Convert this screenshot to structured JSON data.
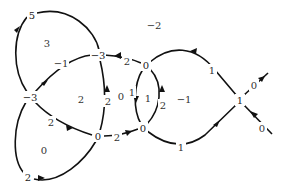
{
  "diagram": {
    "vertices": [
      {
        "id": "v5",
        "label": "5",
        "x": 32,
        "y": 15
      },
      {
        "id": "vL",
        "label": "−3",
        "x": 30,
        "y": 97
      },
      {
        "id": "vT",
        "label": "−3",
        "x": 98,
        "y": 55
      },
      {
        "id": "v0top",
        "label": "0",
        "x": 146,
        "y": 65
      },
      {
        "id": "v0mid",
        "label": "0",
        "x": 98,
        "y": 136
      },
      {
        "id": "v0br",
        "label": "0",
        "x": 143,
        "y": 128
      },
      {
        "id": "vR",
        "label": "1",
        "x": 240,
        "y": 100
      },
      {
        "id": "v2bl",
        "label": "2",
        "x": 28,
        "y": 177
      }
    ],
    "edge_labels": [
      {
        "id": "e-m1",
        "label": "−1",
        "x": 61,
        "y": 63
      },
      {
        "id": "e-2top",
        "label": "2",
        "x": 127,
        "y": 61
      },
      {
        "id": "e-2vert",
        "label": "2",
        "x": 108,
        "y": 101
      },
      {
        "id": "e-1vert",
        "label": "1",
        "x": 132,
        "y": 92
      },
      {
        "id": "e-2right",
        "label": "2",
        "x": 163,
        "y": 105
      },
      {
        "id": "e-1upper",
        "label": "1",
        "x": 212,
        "y": 70
      },
      {
        "id": "e-0ne",
        "label": "0",
        "x": 254,
        "y": 85
      },
      {
        "id": "e-0se",
        "label": "0",
        "x": 262,
        "y": 128
      },
      {
        "id": "e-2left",
        "label": "2",
        "x": 51,
        "y": 122
      },
      {
        "id": "e-2mid",
        "label": "2",
        "x": 117,
        "y": 137
      },
      {
        "id": "e-1bottom",
        "label": "1",
        "x": 181,
        "y": 147
      }
    ],
    "region_labels": [
      {
        "id": "r3",
        "label": "3",
        "x": 47,
        "y": 43
      },
      {
        "id": "rm2",
        "label": "−2",
        "x": 154,
        "y": 25
      },
      {
        "id": "r2",
        "label": "2",
        "x": 81,
        "y": 99
      },
      {
        "id": "r0a",
        "label": "0",
        "x": 121,
        "y": 96
      },
      {
        "id": "r1",
        "label": "1",
        "x": 148,
        "y": 98
      },
      {
        "id": "rm1",
        "label": "−1",
        "x": 184,
        "y": 99
      },
      {
        "id": "r0b",
        "label": "0",
        "x": 44,
        "y": 150
      }
    ]
  }
}
